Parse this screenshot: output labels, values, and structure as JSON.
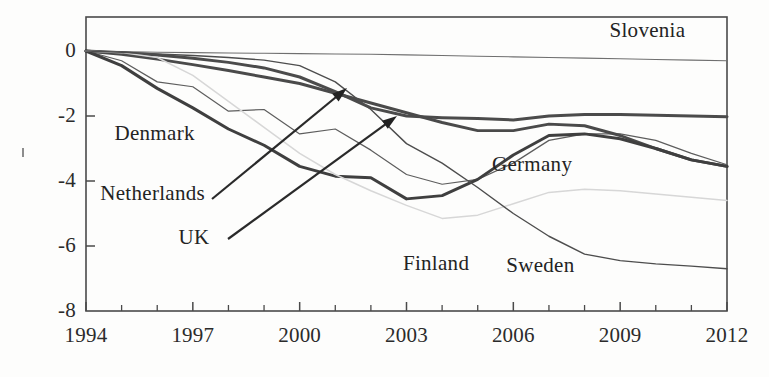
{
  "figure": {
    "name": "net-migration-line-chart",
    "background": "#fdfdfc",
    "frame_color": "#4a4a4a"
  },
  "chart_data": {
    "type": "line",
    "title": "",
    "subtitle": "",
    "xlabel": "",
    "ylabel": "",
    "xlim": [
      1994,
      2012
    ],
    "ylim": [
      -8,
      1
    ],
    "grid": false,
    "legend": "inline-labels",
    "x": [
      1994,
      1995,
      1996,
      1997,
      1998,
      1999,
      2000,
      2001,
      2002,
      2003,
      2004,
      2005,
      2006,
      2007,
      2008,
      2009,
      2010,
      2011,
      2012
    ],
    "xticks": [
      1994,
      1997,
      2000,
      2003,
      2006,
      2009,
      2012
    ],
    "xticklabels": [
      "1994",
      "1997",
      "2000",
      "2003",
      "2006",
      "2009",
      "2012"
    ],
    "xminorticks": [
      1995,
      1996,
      1998,
      1999,
      2001,
      2002,
      2004,
      2005,
      2007,
      2008,
      2010,
      2011
    ],
    "yticks": [
      0,
      -2,
      -4,
      -6,
      -8
    ],
    "yticklabels": [
      "0",
      "-2",
      "-4",
      "-6",
      "-8"
    ],
    "series": [
      {
        "name": "Slovenia",
        "color": "#6f6f6f",
        "width": 1.1,
        "label_x": 2008.7,
        "label_y": 0.62,
        "values": [
          0.0,
          -0.02,
          -0.04,
          -0.05,
          -0.06,
          -0.07,
          -0.08,
          -0.09,
          -0.1,
          -0.12,
          -0.14,
          -0.16,
          -0.18,
          -0.2,
          -0.22,
          -0.24,
          -0.26,
          -0.28,
          -0.3
        ]
      },
      {
        "name": "Germany",
        "color": "#4b4b4b",
        "width": 3.0,
        "label_x": 2005.4,
        "label_y": -3.5,
        "values": [
          0.0,
          -0.05,
          -0.12,
          -0.22,
          -0.35,
          -0.52,
          -0.8,
          -1.25,
          -1.75,
          -2.0,
          -2.05,
          -2.08,
          -2.12,
          -2.0,
          -1.95,
          -1.95,
          -1.98,
          -2.0,
          -2.02
        ]
      },
      {
        "name": "Denmark",
        "color": "#5d5d5d",
        "width": 1.2,
        "label_x": 1994.8,
        "label_y": -2.55,
        "values": [
          0.0,
          -0.3,
          -0.95,
          -1.1,
          -1.85,
          -1.8,
          -2.55,
          -2.4,
          -3.05,
          -3.8,
          -4.1,
          -3.95,
          -3.45,
          -2.75,
          -2.55,
          -2.55,
          -2.75,
          -3.15,
          -3.5
        ]
      },
      {
        "name": "Netherlands",
        "color": "#4a4a4a",
        "width": 2.9,
        "label_x": 1994.4,
        "label_y": -4.4,
        "values": [
          0.0,
          -0.1,
          -0.25,
          -0.42,
          -0.6,
          -0.8,
          -1.0,
          -1.3,
          -1.6,
          -1.9,
          -2.2,
          -2.45,
          -2.45,
          -2.25,
          -2.3,
          -2.6,
          -3.0,
          -3.35,
          -3.55
        ]
      },
      {
        "name": "UK",
        "color": "#3f3f3f",
        "width": 3.0,
        "label_x": 1996.6,
        "label_y": -5.75,
        "values": [
          0.0,
          -0.45,
          -1.15,
          -1.75,
          -2.4,
          -2.9,
          -3.55,
          -3.85,
          -3.9,
          -4.55,
          -4.45,
          -3.95,
          -3.2,
          -2.6,
          -2.55,
          -2.7,
          -3.0,
          -3.35,
          -3.55
        ]
      },
      {
        "name": "Finland",
        "color": "#d7d7d7",
        "width": 1.5,
        "label_x": 2002.9,
        "label_y": -6.55,
        "values": [
          0.0,
          -0.05,
          -0.2,
          -0.75,
          -1.55,
          -2.35,
          -3.15,
          -3.8,
          -4.3,
          -4.75,
          -5.15,
          -5.05,
          -4.7,
          -4.35,
          -4.25,
          -4.3,
          -4.4,
          -4.5,
          -4.6
        ]
      },
      {
        "name": "Sweden",
        "color": "#4d4d4d",
        "width": 1.4,
        "label_x": 2005.8,
        "label_y": -6.6,
        "values": [
          0.0,
          -0.04,
          -0.09,
          -0.14,
          -0.2,
          -0.28,
          -0.45,
          -0.95,
          -1.8,
          -2.85,
          -3.45,
          -4.2,
          -5.0,
          -5.7,
          -6.25,
          -6.45,
          -6.55,
          -6.62,
          -6.7
        ]
      }
    ],
    "annotations": [
      {
        "name": "netherlands-arrow",
        "from": [
          1997.55,
          -4.45
        ],
        "to": [
          11.3,
          0
        ],
        "target": [
          2001.35,
          -1.1
        ],
        "color": "#2a2a2a"
      },
      {
        "name": "uk-arrow",
        "from": [
          1998.0,
          -5.7
        ],
        "to": [
          0,
          0
        ],
        "target": [
          2002.7,
          -1.92
        ],
        "color": "#2a2a2a"
      }
    ]
  }
}
